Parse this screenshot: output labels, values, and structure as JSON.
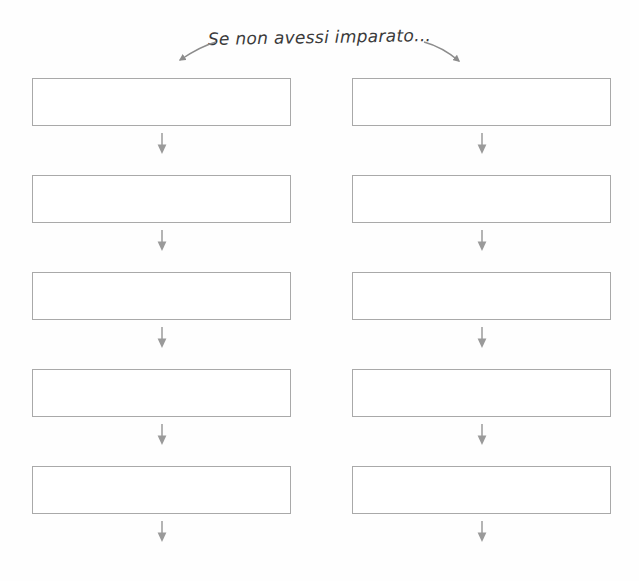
{
  "page": {
    "title": "Se non avessi imparato...",
    "language": "it",
    "document_type": "worksheet",
    "background_color": "#fefefe",
    "width": 639,
    "height": 581
  },
  "header": {
    "prompt_text": "Se non avessi imparato...",
    "arrow_left_name": "header-arrow-left",
    "arrow_right_name": "header-arrow-right",
    "arrow_color": "#8c8c8c"
  },
  "style": {
    "box_border_color": "#a9a9a9",
    "line_color": "#555555",
    "arrow_color": "#8c8c8c",
    "ink_color": "#3a3a3a"
  },
  "columns": [
    {
      "name": "column-left",
      "rows": [
        {
          "box_value": "",
          "line_value": ""
        },
        {
          "box_value": "",
          "line_value": ""
        },
        {
          "box_value": "",
          "line_value": ""
        },
        {
          "box_value": "",
          "line_value": ""
        },
        {
          "box_value": "",
          "line_value": ""
        }
      ]
    },
    {
      "name": "column-right",
      "rows": [
        {
          "box_value": "",
          "line_value": ""
        },
        {
          "box_value": "",
          "line_value": ""
        },
        {
          "box_value": "",
          "line_value": ""
        },
        {
          "box_value": "",
          "line_value": ""
        },
        {
          "box_value": "",
          "line_value": ""
        }
      ]
    }
  ]
}
